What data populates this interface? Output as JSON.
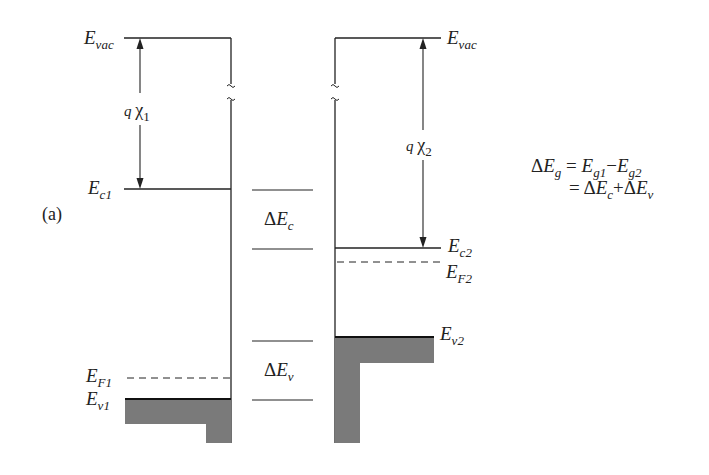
{
  "figure": {
    "panel_label": "(a)",
    "left_material": {
      "vacuum_level": {
        "symbol": "E",
        "subscript": "vac"
      },
      "electron_affinity": {
        "prefix": "q",
        "symbol": "χ",
        "subscript": "1"
      },
      "conduction_band": {
        "symbol": "E",
        "subscript": "c1"
      },
      "fermi_level": {
        "symbol": "E",
        "subscript": "F1"
      },
      "valence_band": {
        "symbol": "E",
        "subscript": "v1"
      }
    },
    "right_material": {
      "vacuum_level": {
        "symbol": "E",
        "subscript": "vac"
      },
      "electron_affinity": {
        "prefix": "q",
        "symbol": "χ",
        "subscript": "2"
      },
      "conduction_band": {
        "symbol": "E",
        "subscript": "c2"
      },
      "fermi_level": {
        "symbol": "E",
        "subscript": "F2"
      },
      "valence_band": {
        "symbol": "E",
        "subscript": "v2"
      }
    },
    "offsets": {
      "conduction": {
        "delta": "Δ",
        "symbol": "E",
        "subscript": "c"
      },
      "valence": {
        "delta": "Δ",
        "symbol": "E",
        "subscript": "v"
      }
    },
    "equation": {
      "line1": {
        "lhs_delta": "Δ",
        "lhs_symbol": "E",
        "lhs_sub": "g",
        "equals": "=",
        "t1": "E",
        "t1_sub": "g1",
        "minus": "−",
        "t2": "E",
        "t2_sub": "g2"
      },
      "line2": {
        "equals": "=",
        "d1": "Δ",
        "s1": "E",
        "s1_sub": "c",
        "plus": "+",
        "d2": "Δ",
        "s2": "E",
        "s2_sub": "v"
      }
    },
    "break_mark": "~",
    "colors": {
      "line": "#222222",
      "fill": "#7a7a7a"
    }
  }
}
